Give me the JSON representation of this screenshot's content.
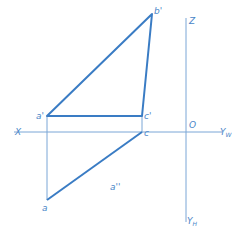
{
  "diagram": {
    "type": "orthographic-projection",
    "colors": {
      "line": "#3a7cc4",
      "thin": "#7aa6d6",
      "label": "#4a86c8"
    },
    "axes": {
      "x_label": "X",
      "z_label": "Z",
      "origin_label": "O",
      "yw_label": "Y",
      "yw_sub": "W",
      "yh_label": "Y",
      "yh_sub": "H"
    },
    "points": {
      "a_prime": "a'",
      "b_prime": "b'",
      "c_prime": "c'",
      "c": "c",
      "a": "a",
      "a_double_prime": "a''"
    }
  }
}
